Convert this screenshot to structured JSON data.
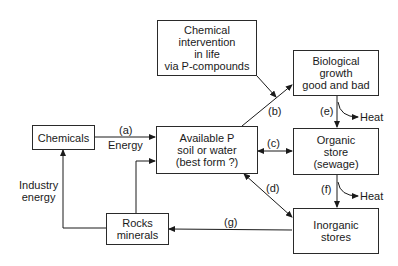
{
  "boxes": {
    "chemical_intervention": [
      "Chemical",
      "intervention",
      "in life",
      "via P-compounds"
    ],
    "biological_growth": [
      "Biological",
      "growth",
      "good and bad"
    ],
    "chemicals": [
      "Chemicals"
    ],
    "available_p": [
      "Available P",
      "soil or water",
      "(best form ?)"
    ],
    "organic_store": [
      "Organic",
      "store",
      "(sewage)"
    ],
    "inorganic_stores": [
      "Inorganic",
      "stores"
    ],
    "rocks_minerals": [
      "Rocks",
      "minerals"
    ]
  },
  "labels": {
    "a": "(a)",
    "energy": "Energy",
    "b": "(b)",
    "c": "(c)",
    "d": "(d)",
    "e": "(e)",
    "f": "(f)",
    "g": "(g)",
    "heat_e": "Heat",
    "heat_f": "Heat",
    "industry_energy": [
      "Industry",
      "energy"
    ]
  }
}
